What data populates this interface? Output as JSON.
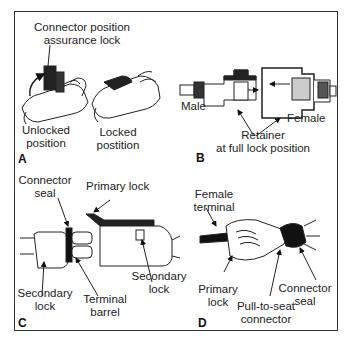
{
  "figure": {
    "panels": [
      {
        "letter": "A",
        "labels": {
          "cpa_line1": "Connector position",
          "cpa_line2": "assurance lock",
          "unlocked_line1": "Unlocked",
          "unlocked_line2": "position",
          "locked_line1": "Locked",
          "locked_line2": "postition"
        }
      },
      {
        "letter": "B",
        "labels": {
          "male": "Male",
          "female": "Female",
          "retainer_line1": "Retainer",
          "retainer_line2": "at full lock position"
        }
      },
      {
        "letter": "C",
        "labels": {
          "seal_line1": "Connector",
          "seal_line2": "seal",
          "primary_lock": "Primary lock",
          "secondary_left_line1": "Secondary",
          "secondary_left_line2": "lock",
          "terminal_line1": "Terminal",
          "terminal_line2": "barrel",
          "secondary_right_line1": "Secondary",
          "secondary_right_line2": "lock"
        }
      },
      {
        "letter": "D",
        "labels": {
          "female_terminal_line1": "Female",
          "female_terminal_line2": "terminal",
          "primary_lock_line1": "Primary",
          "primary_lock_line2": "lock",
          "pull_to_seat_line1": "Pull-to-seat",
          "pull_to_seat_line2": "connector",
          "seal_line1": "Connector",
          "seal_line2": "seal"
        }
      }
    ]
  }
}
